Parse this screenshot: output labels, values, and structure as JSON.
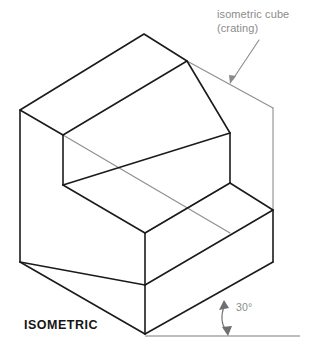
{
  "figure": {
    "view_title": "ISOMETRIC",
    "callout": {
      "line1": "isometric cube",
      "line2": "(crating)"
    },
    "angle": {
      "label": "30°",
      "value": 30,
      "unit": "degrees"
    }
  },
  "colors": {
    "solid_edge": "#1b1b1b",
    "crate_edge": "#8e8e8e",
    "ground_line": "#7d7d7d",
    "callout_text": "#8c8c8c",
    "title_text": "#151515",
    "background": "#ffffff"
  },
  "geometry": {
    "description": "Two-step isometric block drawn inside a light-gray isometric crating cube, with a 30 degree angle annotation from the horizontal ground line to the lower-right isometric edge.",
    "projection": "isometric",
    "axis_angle_from_horizontal": 30,
    "solid_vertices": {
      "top_apex": [
        144,
        34
      ],
      "top_right": [
        187,
        61
      ],
      "left_top": [
        20,
        110
      ],
      "inner_upper": [
        63,
        135
      ],
      "left_bottom": [
        20,
        262
      ],
      "step1_inner": [
        63,
        185
      ],
      "step2_right_top": [
        230,
        133
      ],
      "step2_right_bottom": [
        230,
        183
      ],
      "mid_front": [
        145,
        233
      ],
      "mid_front_bottom": [
        145,
        285
      ],
      "right_step_top": [
        273,
        210
      ],
      "right_step_bottom": [
        273,
        262
      ],
      "bottom_front": [
        145,
        334
      ]
    },
    "crate_vertices": {
      "crate_top_right": [
        273,
        108
      ],
      "crate_right_vertical_end": [
        273,
        210
      ]
    },
    "ground_line": {
      "from": [
        145,
        336
      ],
      "to": [
        300,
        336
      ]
    }
  }
}
